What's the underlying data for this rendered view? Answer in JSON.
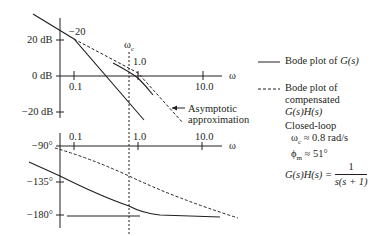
{
  "magnitude_plot": {
    "y_ticks": [
      "20 dB",
      "0 dB",
      "−20 dB"
    ],
    "x_ticks": [
      "0.1",
      "1.0",
      "10.0"
    ],
    "x_axis_label": "ω",
    "slope_label": "−20",
    "crossover_label": "ω",
    "crossover_sub": "c",
    "asymptote_note": [
      "Asymptotic",
      "approximation"
    ]
  },
  "phase_plot": {
    "y_ticks": [
      "−90°",
      "−135°",
      "−180°"
    ],
    "x_ticks": [
      "0.1",
      "1.0",
      "10.0"
    ],
    "x_axis_label": "ω"
  },
  "legend": {
    "solid": "Bode plot of G(s)",
    "solid_parts": [
      "Bode plot of ",
      "G(s)"
    ],
    "dashed": [
      "Bode plot of",
      "compensated",
      "G(s)H(s)"
    ]
  },
  "annotations": {
    "closed_loop_title": "Closed-loop",
    "wc_symbol": "ω",
    "wc_sub": "c",
    "wc_value": " ≈ 0.8 rad/s",
    "pm_symbol": "ϕ",
    "pm_sub": "m",
    "pm_value": " ≈ 51°",
    "transfer_lhs": "G(s)H(s) = ",
    "transfer_num": "1",
    "transfer_den": "s(s + 1)"
  },
  "colors": {
    "ink": "#231f20",
    "background": "#ffffff"
  }
}
